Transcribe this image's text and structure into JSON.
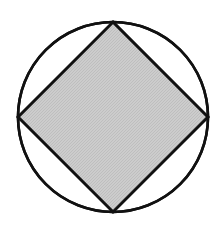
{
  "figure": {
    "background_color": "#ffffff"
  },
  "chart_data": {
    "type": "diagram",
    "subtype": "geometric-figure",
    "canvas": {
      "width": 220,
      "height": 225,
      "units": "px"
    },
    "title": "",
    "xlabel": "",
    "ylabel": "",
    "grid": false,
    "legend": null,
    "annotations": [],
    "tick_labels": [],
    "shapes": [
      {
        "name": "circumscribed-circle",
        "kind": "circle",
        "center": {
          "x": 113,
          "y": 117
        },
        "radius": 95,
        "fill": "none",
        "stroke": "#111111",
        "stroke_width": 2.6
      },
      {
        "name": "inscribed-square",
        "kind": "polygon",
        "sides": 4,
        "rotation_degrees": 45,
        "vertices": [
          {
            "label": "top",
            "x": 113,
            "y": 22
          },
          {
            "label": "right",
            "x": 208,
            "y": 117
          },
          {
            "label": "bottom",
            "x": 113,
            "y": 212
          },
          {
            "label": "left",
            "x": 18,
            "y": 117
          }
        ],
        "side_length": 134.4,
        "fill": "#c9c9c9",
        "stroke": "#111111",
        "stroke_width": 2.6
      }
    ],
    "colors": {
      "background": "#ffffff",
      "stroke": "#111111",
      "square_fill": "#c9c9c9",
      "segment_fill": "#ffffff"
    }
  }
}
